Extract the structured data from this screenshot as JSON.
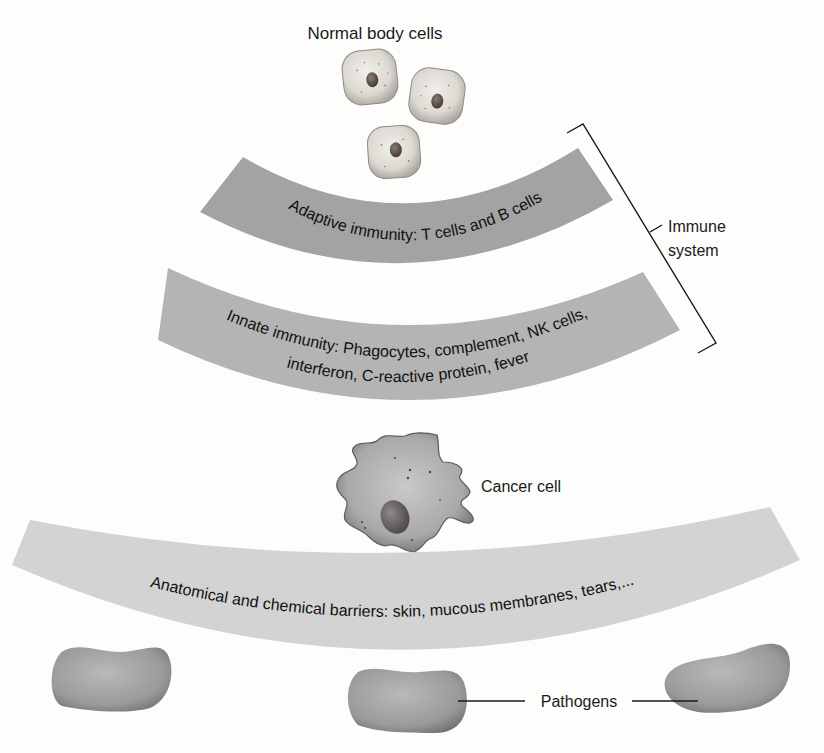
{
  "diagram": {
    "title": "Normal body cells",
    "bands": [
      {
        "id": "adaptive",
        "label": "Adaptive immunity: T cells and B cells",
        "color": "#a3a3a3"
      },
      {
        "id": "innate",
        "label_line1": "Innate immunity: Phagocytes, complement, NK cells,",
        "label_line2": "interferon, C-reactive protein, fever",
        "color": "#b4b4b4"
      },
      {
        "id": "barriers",
        "label": "Anatomical and chemical barriers: skin, mucous membranes, tears,...",
        "color": "#d3d3d3"
      }
    ],
    "bracket": {
      "line1": "Immune",
      "line2": "system"
    },
    "cancer_cell_label": "Cancer cell",
    "pathogens_label": "Pathogens",
    "colors": {
      "background": "#fdfdfc",
      "text": "#1a1a1a",
      "line": "#1a1a1a",
      "cell_fill": "#d9d6cf",
      "nucleus": "#5a4e48",
      "pathogen": "#9a9a9a"
    }
  }
}
